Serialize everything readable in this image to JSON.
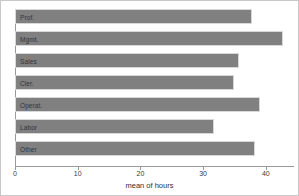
{
  "chart_data": {
    "type": "bar",
    "orientation": "horizontal",
    "title": "",
    "subtitle": "",
    "xlabel": "mean of hours",
    "ylabel": "",
    "categories": [
      "Prof.",
      "Mgmt.",
      "Sales",
      "Cler.",
      "Operat.",
      "Labor",
      "Other"
    ],
    "values": [
      37.8,
      42.8,
      35.8,
      35.0,
      39.0,
      31.8,
      38.2
    ],
    "xlim": [
      0,
      44.5
    ],
    "xticks": [
      0,
      10,
      20,
      30,
      40
    ],
    "xticklabels": [
      "0",
      "10",
      "20",
      "30",
      "40"
    ],
    "grid": false,
    "legend": null,
    "bar_color": "#808080",
    "bar_edge_color": "#d8d8d8",
    "axis_color": "#9a9a9a",
    "background_color": "#ffffff",
    "border_color": "#c8c8c8",
    "label_placement": "inside-left-of-bar"
  }
}
